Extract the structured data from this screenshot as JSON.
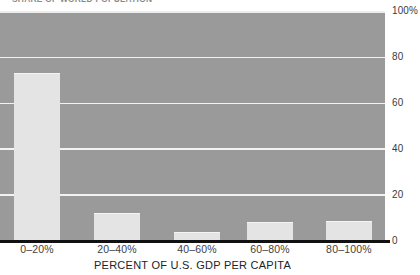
{
  "chart_data": {
    "type": "bar",
    "title": "SHARE OF WORLD POPULATION",
    "xlabel": "PERCENT OF U.S. GDP PER CAPITA",
    "ylabel": "",
    "categories": [
      "0–20%",
      "20–40%",
      "40–60%",
      "60–80%",
      "80–100%"
    ],
    "values": [
      73,
      12,
      3.5,
      8,
      8.5
    ],
    "ylim": [
      0,
      100
    ],
    "yticks": [
      "0",
      "20",
      "40",
      "60",
      "80",
      "100%"
    ],
    "ytick_values": [
      0,
      20,
      40,
      60,
      80,
      100
    ],
    "grid": true,
    "legend": false,
    "colors": {
      "plot_background": "#9a9a9a",
      "bar_fill": "#e4e4e4",
      "gridline": "#f2f2f2",
      "axis_line": "#111111",
      "tick_label": "#3f3f3f"
    }
  },
  "axes": {
    "y_ticks": [
      {
        "label": "100%",
        "value": 100
      },
      {
        "label": "80",
        "value": 80
      },
      {
        "label": "60",
        "value": 60
      },
      {
        "label": "40",
        "value": 40
      },
      {
        "label": "20",
        "value": 20
      },
      {
        "label": "0",
        "value": 0
      }
    ],
    "x_ticks": [
      {
        "label": "0–20%"
      },
      {
        "label": "20–40%"
      },
      {
        "label": "40–60%"
      },
      {
        "label": "60–80%"
      },
      {
        "label": "80–100%"
      }
    ],
    "x_title": "PERCENT OF U.S. GDP PER CAPITA"
  },
  "bars": [
    {
      "label": "0–20%",
      "value": 73
    },
    {
      "label": "20–40%",
      "value": 12
    },
    {
      "label": "40–60%",
      "value": 3.5
    },
    {
      "label": "60–80%",
      "value": 8
    },
    {
      "label": "80–100%",
      "value": 8.5
    }
  ]
}
